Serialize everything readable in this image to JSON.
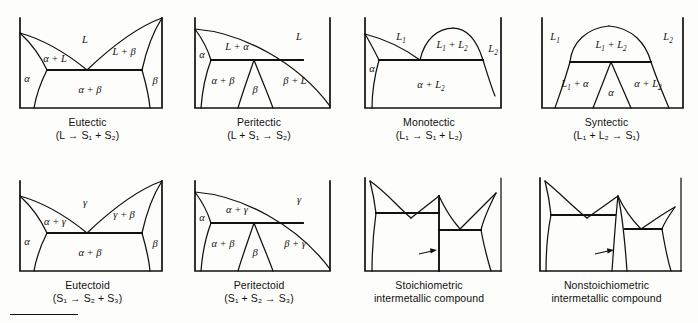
{
  "figure": {
    "columns": 4,
    "rows": 2,
    "background_color": "#fdfdfb",
    "line_color": "#111111"
  },
  "diagrams": [
    {
      "id": "eutectic",
      "name": "Eutectic",
      "caption_line1": "Eutectic",
      "caption_line2": "(L → S₁ + S₂)",
      "reaction": "L → S1 + S2",
      "region_labels": [
        "L",
        "α + L",
        "L + β",
        "α",
        "β",
        "α + β"
      ],
      "phases": [
        "L",
        "α",
        "β"
      ]
    },
    {
      "id": "peritectic",
      "name": "Peritectic",
      "caption_line1": "Peritectic",
      "caption_line2": "(L + S₁ → S₂)",
      "reaction": "L + S1 → S2",
      "region_labels": [
        "L",
        "L + α",
        "α",
        "α + β",
        "β",
        "β + L"
      ],
      "phases": [
        "L",
        "α",
        "β"
      ]
    },
    {
      "id": "monotectic",
      "name": "Monotectic",
      "caption_line1": "Monotectic",
      "caption_line2": "(L₁ → S₁ + L₂)",
      "reaction": "L1 → S1 + L2",
      "region_labels": [
        "L₁",
        "L₁ + L₂",
        "L₂",
        "α",
        "α + L₂"
      ],
      "phases": [
        "L1",
        "L2",
        "α"
      ]
    },
    {
      "id": "syntectic",
      "name": "Syntectic",
      "caption_line1": "Syntectic",
      "caption_line2": "(L₁ + L₂ → S₁)",
      "reaction": "L1 + L2 → S1",
      "region_labels": [
        "L₁",
        "L₁ + L₂",
        "L₂",
        "L₁ + α",
        "α",
        "α + L₂"
      ],
      "phases": [
        "L1",
        "L2",
        "α"
      ]
    },
    {
      "id": "eutectoid",
      "name": "Eutectoid",
      "caption_line1": "Eutectoid",
      "caption_line2": "(S₁ → S₂ + S₃)",
      "reaction": "S1 → S2 + S3",
      "region_labels": [
        "γ",
        "α + γ",
        "γ + β",
        "α",
        "β",
        "α + β"
      ],
      "phases": [
        "γ",
        "α",
        "β"
      ]
    },
    {
      "id": "peritectoid",
      "name": "Peritectoid",
      "caption_line1": "Peritectoid",
      "caption_line2": "(S₁ + S₂ → S₃)",
      "reaction": "S1 + S2 → S3",
      "region_labels": [
        "γ",
        "α + γ",
        "α",
        "α + β",
        "β",
        "β + γ"
      ],
      "phases": [
        "γ",
        "α",
        "β"
      ]
    },
    {
      "id": "stoichiometric",
      "name": "Stoichiometric intermetallic compound",
      "caption_line1": "Stoichiometric",
      "caption_line2": "intermetallic compound",
      "reaction": "",
      "region_labels": [],
      "annotation": "arrow pointing to vertical line compound",
      "phases": []
    },
    {
      "id": "nonstoichiometric",
      "name": "Nonstoichiometric intermetallic compound",
      "caption_line1": "Nonstoichiometric",
      "caption_line2": "intermetallic compound",
      "reaction": "",
      "region_labels": [],
      "annotation": "arrow pointing to narrow compound field",
      "phases": []
    }
  ],
  "labels": {
    "L": "L",
    "L1": "L₁",
    "L2": "L₂",
    "alpha": "α",
    "beta": "β",
    "gamma": "γ",
    "alpha_plus_L": "α + L",
    "L_plus_beta": "L + β",
    "alpha_plus_beta": "α + β",
    "L_plus_alpha": "L + α",
    "beta_plus_L": "β + L",
    "L1_plus_L2": "L₁ + L₂",
    "alpha_plus_L2": "α + L₂",
    "L1_plus_alpha": "L₁ + α",
    "alpha_plus_gamma": "α + γ",
    "gamma_plus_beta": "γ + β",
    "beta_plus_gamma": "β + γ"
  }
}
